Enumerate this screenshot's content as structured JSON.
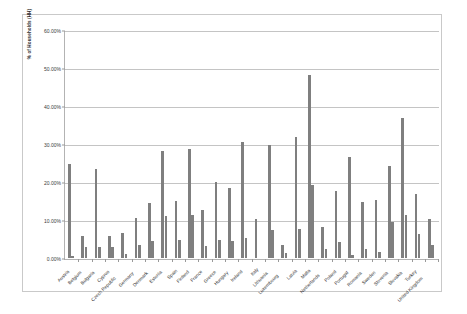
{
  "chart_data": {
    "type": "bar",
    "title": "",
    "subtitle": "",
    "xlabel": "",
    "ylabel": "% of Households (HH)",
    "ylim": [
      0,
      0.6
    ],
    "ytick_labels": [
      "60.00%",
      "50.00%",
      "40.00%",
      "30.00%",
      "20.00%",
      "10.00%",
      "0.00%"
    ],
    "ytick_values": [
      0.6,
      0.5,
      0.4,
      0.3,
      0.2,
      0.1,
      0.0
    ],
    "grid": true,
    "legend": "none",
    "bar_color": "#7f7f7f",
    "categories": [
      "Austria",
      "Belgium",
      "Bulgaria",
      "Cyprus",
      "Czech Republic",
      "Germany",
      "Denmark",
      "Estonia",
      "Spain",
      "Finland",
      "France",
      "Greece",
      "Hungary",
      "Ireland",
      "Italy",
      "Lithuania",
      "Luxembourg",
      "Latvia",
      "Malta",
      "Netherlands",
      "Poland",
      "Portugal",
      "Romania",
      "Sweden",
      "Slovenia",
      "Slovakia",
      "Turkey",
      "United Kingdom"
    ],
    "series": [
      {
        "name": "Series 1",
        "values": [
          0.249,
          0.059,
          0.236,
          0.057,
          0.067,
          0.106,
          0.145,
          0.283,
          0.152,
          0.289,
          0.127,
          0.202,
          0.184,
          0.306,
          0.103,
          0.3,
          0.034,
          0.321,
          0.483,
          0.082,
          0.178,
          0.266,
          0.149,
          0.153,
          0.243,
          0.369,
          0.17,
          0.104
        ]
      },
      {
        "name": "Series 2",
        "values": [
          0.005,
          0.029,
          0.029,
          0.029,
          0.011,
          0.034,
          0.046,
          0.112,
          0.048,
          0.115,
          0.031,
          0.047,
          0.045,
          0.052,
          0.0,
          0.073,
          0.014,
          0.077,
          0.194,
          0.023,
          0.042,
          0.008,
          0.023,
          0.015,
          0.096,
          0.114,
          0.063,
          0.034
        ]
      },
      {
        "name": "Series 3",
        "values": [
          0.0,
          0.0,
          0.0,
          0.0,
          0.0,
          0.0,
          0.0,
          0.0,
          0.0,
          0.0,
          0.0,
          0.0,
          0.0,
          0.0,
          0.0,
          0.0,
          0.0,
          0.0,
          0.0,
          0.0,
          0.0,
          0.0,
          0.0,
          0.0,
          0.0,
          0.0,
          0.0,
          0.0
        ]
      }
    ]
  }
}
